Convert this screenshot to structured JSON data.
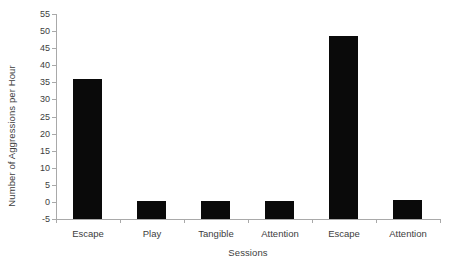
{
  "chart_data": {
    "type": "bar",
    "title": "",
    "subtitle": "",
    "xlabel": "Sessions",
    "ylabel": "Number of Aggressions per Hour",
    "categories": [
      "Escape",
      "Play",
      "Tangible",
      "Attention",
      "Escape",
      "Attention"
    ],
    "values": [
      36.0,
      0.2,
      0.3,
      0.4,
      48.5,
      0.7
    ],
    "series": [
      {
        "name": "Aggressions per Hour",
        "values": [
          36.0,
          0.2,
          0.3,
          0.4,
          48.5,
          0.7
        ]
      }
    ],
    "ylim": [
      -5,
      55
    ],
    "ytick_labels": [
      "55",
      "50",
      "45",
      "40",
      "35",
      "30",
      "25",
      "20",
      "15",
      "10",
      "5",
      "0",
      "-5"
    ],
    "ytick_values": [
      55,
      50,
      45,
      40,
      35,
      30,
      25,
      20,
      15,
      10,
      5,
      0,
      -5
    ],
    "grid": false,
    "legend": false,
    "legend_position": "none",
    "bar_color": "#0a0a0a",
    "axis_color": "#a9a9a9",
    "text_color": "#3d3d3d",
    "background_color": "#ffffff",
    "baseline_value": -5,
    "annotations": []
  }
}
